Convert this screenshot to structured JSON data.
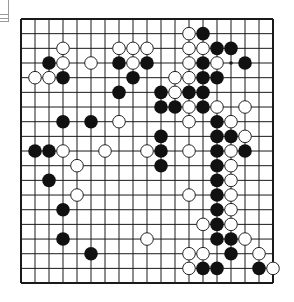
{
  "board": {
    "size": 19,
    "origin_x": 21,
    "origin_y": 19,
    "spacing_x": 14,
    "spacing_y": 14.67,
    "stone_radius": 6.8,
    "line_color": "#1a1a1a",
    "border_color": "#1a1a1a",
    "black_color": "#111111",
    "white_fill": "#ffffff",
    "white_stroke": "#222222",
    "star_points_visible": [
      [
        15,
        3
      ]
    ],
    "black_stones": [
      [
        13,
        1
      ],
      [
        14,
        2
      ],
      [
        15,
        2
      ],
      [
        2,
        3
      ],
      [
        7,
        3
      ],
      [
        9,
        3
      ],
      [
        13,
        3
      ],
      [
        16,
        3
      ],
      [
        3,
        4
      ],
      [
        8,
        4
      ],
      [
        13,
        4
      ],
      [
        14,
        4
      ],
      [
        7,
        5
      ],
      [
        10,
        5
      ],
      [
        12,
        5
      ],
      [
        13,
        5
      ],
      [
        10,
        6
      ],
      [
        11,
        6
      ],
      [
        13,
        6
      ],
      [
        3,
        7
      ],
      [
        5,
        7
      ],
      [
        14,
        7
      ],
      [
        10,
        8
      ],
      [
        14,
        8
      ],
      [
        15,
        8
      ],
      [
        1,
        9
      ],
      [
        2,
        9
      ],
      [
        10,
        9
      ],
      [
        14,
        9
      ],
      [
        16,
        9
      ],
      [
        10,
        10
      ],
      [
        14,
        10
      ],
      [
        2,
        11
      ],
      [
        14,
        11
      ],
      [
        14,
        12
      ],
      [
        3,
        13
      ],
      [
        14,
        13
      ],
      [
        14,
        14
      ],
      [
        3,
        15
      ],
      [
        14,
        15
      ],
      [
        15,
        15
      ],
      [
        5,
        16
      ],
      [
        15,
        16
      ],
      [
        13,
        17
      ],
      [
        14,
        17
      ],
      [
        17,
        17
      ]
    ],
    "white_stones": [
      [
        12,
        1
      ],
      [
        3,
        2
      ],
      [
        7,
        2
      ],
      [
        8,
        2
      ],
      [
        9,
        2
      ],
      [
        12,
        2
      ],
      [
        13,
        2
      ],
      [
        3,
        3
      ],
      [
        5,
        3
      ],
      [
        8,
        3
      ],
      [
        12,
        3
      ],
      [
        14,
        3
      ],
      [
        1,
        4
      ],
      [
        2,
        4
      ],
      [
        11,
        4
      ],
      [
        12,
        4
      ],
      [
        11,
        5
      ],
      [
        12,
        6
      ],
      [
        14,
        6
      ],
      [
        16,
        6
      ],
      [
        7,
        7
      ],
      [
        12,
        7
      ],
      [
        15,
        7
      ],
      [
        16,
        8
      ],
      [
        3,
        9
      ],
      [
        6,
        9
      ],
      [
        9,
        9
      ],
      [
        12,
        9
      ],
      [
        15,
        9
      ],
      [
        4,
        10
      ],
      [
        15,
        10
      ],
      [
        15,
        11
      ],
      [
        4,
        12
      ],
      [
        12,
        12
      ],
      [
        15,
        12
      ],
      [
        15,
        13
      ],
      [
        13,
        14
      ],
      [
        15,
        14
      ],
      [
        9,
        15
      ],
      [
        16,
        15
      ],
      [
        12,
        16
      ],
      [
        13,
        16
      ],
      [
        17,
        16
      ],
      [
        12,
        17
      ],
      [
        18,
        17
      ]
    ]
  }
}
